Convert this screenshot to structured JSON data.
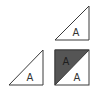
{
  "colors": {
    "background": "#ffffff",
    "stroke": "#3a3a3a",
    "dark_fill": "#555555",
    "light_fill": "#ffffff",
    "label_on_light": "#333333",
    "label_on_dark": "#1e1e1e"
  },
  "shapes": {
    "top_right_triangle": {
      "label": "A",
      "fill": "white",
      "points": [
        [
          55,
          40
        ],
        [
          89,
          6
        ],
        [
          89,
          40
        ]
      ]
    },
    "bottom_left_triangle": {
      "label": "A",
      "fill": "white",
      "points": [
        [
          9,
          85
        ],
        [
          43,
          50
        ],
        [
          43,
          85
        ]
      ]
    },
    "split_square": {
      "x": 55,
      "y": 50,
      "width": 34,
      "height": 35,
      "dark_half": {
        "label": "A",
        "fill": "dark-gray"
      },
      "light_half": {
        "label": "A",
        "fill": "white"
      }
    }
  }
}
